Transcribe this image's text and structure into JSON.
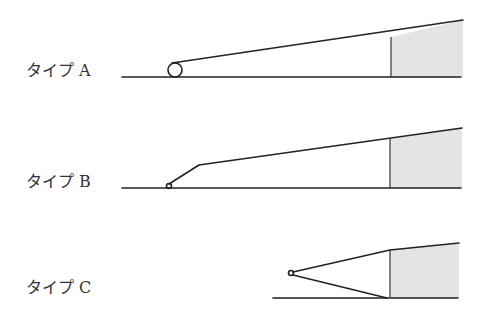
{
  "diagram": {
    "colors": {
      "line": "#222222",
      "shade": "#e4e4e4",
      "text": "#333333",
      "background": "#ffffff"
    },
    "types": [
      {
        "id": "A",
        "label": "タイプ A",
        "label_pos": [
          26,
          76
        ],
        "baseline": [
          122,
          77,
          461,
          77
        ],
        "hinge": {
          "cx": 175,
          "cy": 70,
          "r": 7
        },
        "upper_path": "M 172 63 L 463 20",
        "vertical": [
          391,
          37,
          391,
          77
        ],
        "shade_poly": "391,37 463,20 463,77 391,77"
      },
      {
        "id": "B",
        "label": "タイプ B",
        "label_pos": [
          26,
          187
        ],
        "baseline": [
          122,
          188,
          461,
          188
        ],
        "hinge": {
          "cx": 169,
          "cy": 186,
          "r": 2.5
        },
        "upper_path": "M 169 184 L 199 165 L 462 128",
        "vertical": [
          390,
          139,
          390,
          188
        ],
        "shade_poly": "390,139 462,128 462,188 390,188"
      },
      {
        "id": "C",
        "label": "タイプ C",
        "label_pos": [
          26,
          293
        ],
        "baseline": [
          273,
          298,
          458,
          298
        ],
        "hinge": {
          "cx": 291,
          "cy": 273,
          "r": 2.5
        },
        "upper_path": "M 293 272 L 390 250 L 459 243",
        "lower_path": "M 293 275 L 387 298",
        "vertical": [
          390,
          250,
          390,
          298
        ],
        "shade_poly": "390,250 459,243 459,298 390,298"
      }
    ]
  }
}
